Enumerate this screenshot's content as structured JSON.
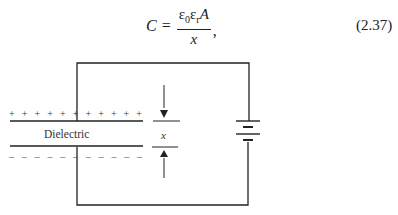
{
  "equation": {
    "lhs": "C",
    "equals": "=",
    "numerator": {
      "eps0": "ε",
      "eps0_sub": "0",
      "epsr": "ε",
      "epsr_sub": "r",
      "area": "A"
    },
    "denominator": "x",
    "trailing": ",",
    "number": "(2.37)"
  },
  "diagram": {
    "plate_top_charges": "+ + + + + + + + + + +",
    "plate_bottom_charges": "– – – – – – – – – – –",
    "dielectric_label": "Dielectric",
    "gap_label": "x",
    "line_color": "#222222"
  }
}
